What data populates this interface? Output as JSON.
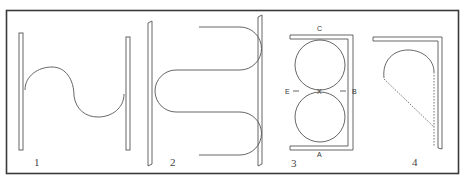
{
  "figure": {
    "panels": [
      {
        "id": 1,
        "label": "1",
        "description": "S-shaped curve between two vertical bars"
      },
      {
        "id": 2,
        "label": "2",
        "description": "Serpentine wire folded between two vertical bars"
      },
      {
        "id": 3,
        "label": "3",
        "description": "Two stacked circles within a C-shaped bracket",
        "points": {
          "top": "C",
          "bottom": "A",
          "left": "E",
          "right": "B",
          "center": "X"
        }
      },
      {
        "id": 4,
        "label": "4",
        "description": "Semicircular loop with dashed lines against an L-shaped bracket"
      }
    ]
  },
  "colors": {
    "line": "#555555",
    "frame": "#3a3a3a",
    "background": "#ffffff"
  }
}
